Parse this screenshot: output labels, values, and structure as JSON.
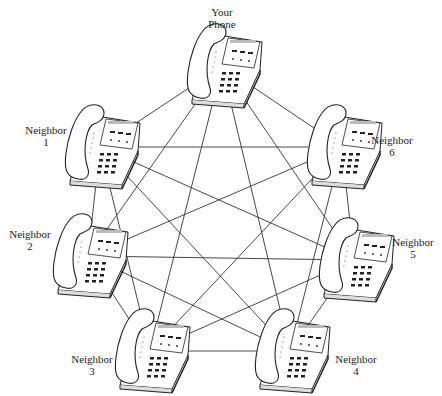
{
  "diagram": {
    "type": "fully-connected mesh network",
    "nodes": [
      {
        "id": "you",
        "label_line1": "Your",
        "label_line2": "Phone",
        "cx": 222,
        "cy": 62,
        "lx": 222,
        "ly": 6
      },
      {
        "id": "n1",
        "label_line1": "Neighbor",
        "label_line2": "1",
        "cx": 100,
        "cy": 143,
        "lx": 46,
        "ly": 127
      },
      {
        "id": "n6",
        "label_line1": "Neighbor",
        "label_line2": "6",
        "cx": 342,
        "cy": 143,
        "lx": 392,
        "ly": 137
      },
      {
        "id": "n2",
        "label_line1": "Neighbor",
        "label_line2": "2",
        "cx": 88,
        "cy": 252,
        "lx": 30,
        "ly": 228
      },
      {
        "id": "n5",
        "label_line1": "Neighbor",
        "label_line2": "5",
        "cx": 354,
        "cy": 256,
        "lx": 413,
        "ly": 240
      },
      {
        "id": "n3",
        "label_line1": "Neighbor",
        "label_line2": "3",
        "cx": 150,
        "cy": 347,
        "lx": 92,
        "ly": 355
      },
      {
        "id": "n4",
        "label_line1": "Neighbor",
        "label_line2": "4",
        "cx": 290,
        "cy": 347,
        "lx": 356,
        "ly": 355
      }
    ],
    "line_color": "#333333",
    "phone_stroke": "#222222",
    "phone_fill": "#ffffff"
  }
}
